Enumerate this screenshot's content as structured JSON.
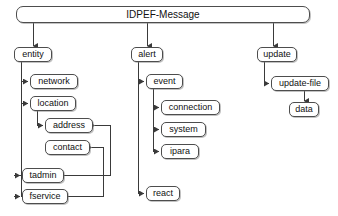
{
  "diagram": {
    "type": "tree",
    "title": "IDPEF-Message",
    "root": {
      "id": "idpef-message",
      "label": "IDPEF-Message"
    },
    "nodes": [
      {
        "id": "idpef-message",
        "label": "IDPEF-Message",
        "level": 0,
        "x": 16,
        "y": 6,
        "w": 294,
        "h": 17
      },
      {
        "id": "entity",
        "label": "entity",
        "level": 1,
        "x": 14,
        "y": 47,
        "w": 38,
        "h": 15
      },
      {
        "id": "network",
        "label": "network",
        "level": 2,
        "x": 30,
        "y": 74,
        "w": 48,
        "h": 15
      },
      {
        "id": "location",
        "label": "location",
        "level": 2,
        "x": 30,
        "y": 96,
        "w": 46,
        "h": 15
      },
      {
        "id": "address",
        "label": "address",
        "level": 3,
        "x": 45,
        "y": 118,
        "w": 48,
        "h": 15
      },
      {
        "id": "contact",
        "label": "contact",
        "level": 3,
        "x": 45,
        "y": 140,
        "w": 45,
        "h": 15
      },
      {
        "id": "tadmin",
        "label": "tadmin",
        "level": 2,
        "x": 22,
        "y": 168,
        "w": 42,
        "h": 15
      },
      {
        "id": "fservice",
        "label": "fservice",
        "level": 2,
        "x": 22,
        "y": 189,
        "w": 46,
        "h": 15
      },
      {
        "id": "alert",
        "label": "alert",
        "level": 1,
        "x": 131,
        "y": 47,
        "w": 32,
        "h": 15
      },
      {
        "id": "event",
        "label": "event",
        "level": 2,
        "x": 146,
        "y": 74,
        "w": 37,
        "h": 15
      },
      {
        "id": "connection",
        "label": "connection",
        "level": 3,
        "x": 161,
        "y": 100,
        "w": 59,
        "h": 15
      },
      {
        "id": "system",
        "label": "system",
        "level": 3,
        "x": 161,
        "y": 122,
        "w": 45,
        "h": 15
      },
      {
        "id": "ipara",
        "label": "ipara",
        "level": 3,
        "x": 161,
        "y": 144,
        "w": 38,
        "h": 15
      },
      {
        "id": "react",
        "label": "react",
        "level": 2,
        "x": 146,
        "y": 186,
        "w": 34,
        "h": 15
      },
      {
        "id": "update",
        "label": "update",
        "level": 1,
        "x": 257,
        "y": 47,
        "w": 40,
        "h": 15
      },
      {
        "id": "update-file",
        "label": "update-file",
        "level": 2,
        "x": 271,
        "y": 76,
        "w": 58,
        "h": 15
      },
      {
        "id": "data",
        "label": "data",
        "level": 3,
        "x": 289,
        "y": 102,
        "w": 30,
        "h": 15
      }
    ],
    "edges": [
      {
        "from": "idpef-message",
        "to": "entity"
      },
      {
        "from": "idpef-message",
        "to": "alert"
      },
      {
        "from": "idpef-message",
        "to": "update"
      },
      {
        "from": "entity",
        "to": "network"
      },
      {
        "from": "entity",
        "to": "location"
      },
      {
        "from": "entity",
        "to": "tadmin"
      },
      {
        "from": "entity",
        "to": "fservice"
      },
      {
        "from": "location",
        "to": "address"
      },
      {
        "from": "tadmin",
        "to": "address"
      },
      {
        "from": "fservice",
        "to": "contact"
      },
      {
        "from": "alert",
        "to": "event"
      },
      {
        "from": "alert",
        "to": "react"
      },
      {
        "from": "event",
        "to": "connection"
      },
      {
        "from": "event",
        "to": "system"
      },
      {
        "from": "event",
        "to": "ipara"
      },
      {
        "from": "update",
        "to": "update-file"
      },
      {
        "from": "update-file",
        "to": "data"
      }
    ],
    "style": {
      "background": "#ffffff",
      "line_color": "#3a3a3a",
      "box_border": "#4d4d4d",
      "box_fill": "#ffffff",
      "text_color": "#111111"
    }
  }
}
